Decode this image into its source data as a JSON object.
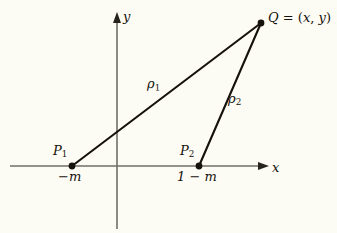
{
  "figure": {
    "type": "geometry-diagram",
    "background_color": "#fdfcf4",
    "ink_color": "#15120c",
    "axis_color": "#6b6b63"
  },
  "axes": {
    "x_label": "x",
    "y_label": "y",
    "x_axis": {
      "x_start": 10,
      "x_end": 268,
      "y": 166,
      "arrow": "right"
    },
    "y_axis": {
      "x": 117,
      "y_start": 14,
      "y_end": 229,
      "arrow": "up"
    }
  },
  "points": [
    {
      "id": "P1",
      "name": "P",
      "sub": "1",
      "tick_label": "−m",
      "x": 72,
      "y": 166
    },
    {
      "id": "P2",
      "name": "P",
      "sub": "2",
      "tick_label": "1 − m",
      "x": 199,
      "y": 166
    },
    {
      "id": "Q",
      "name": "Q",
      "sub": "",
      "tick_label": "",
      "label": "Q = (x, y)",
      "x": 261,
      "y": 23
    }
  ],
  "segments": [
    {
      "id": "rho1",
      "name": "ρ",
      "sub": "1",
      "from": "P1",
      "to": "Q",
      "label": "ρ₁"
    },
    {
      "id": "rho2",
      "name": "ρ",
      "sub": "2",
      "from": "P2",
      "to": "Q",
      "label": "ρ₂"
    }
  ],
  "labels": {
    "q_point": "Q",
    "q_equals": "=",
    "q_open": "(",
    "q_x": "x",
    "q_comma": ",",
    "q_y": "y",
    "q_close": ")",
    "p1_name": "P",
    "p1_sub": "1",
    "p1_tick": "−m",
    "p2_name": "P",
    "p2_sub": "2",
    "p2_tick": "1 − m",
    "rho1_name": "ρ",
    "rho1_sub": "1",
    "rho2_name": "ρ",
    "rho2_sub": "2",
    "axis_x": "x",
    "axis_y": "y"
  }
}
